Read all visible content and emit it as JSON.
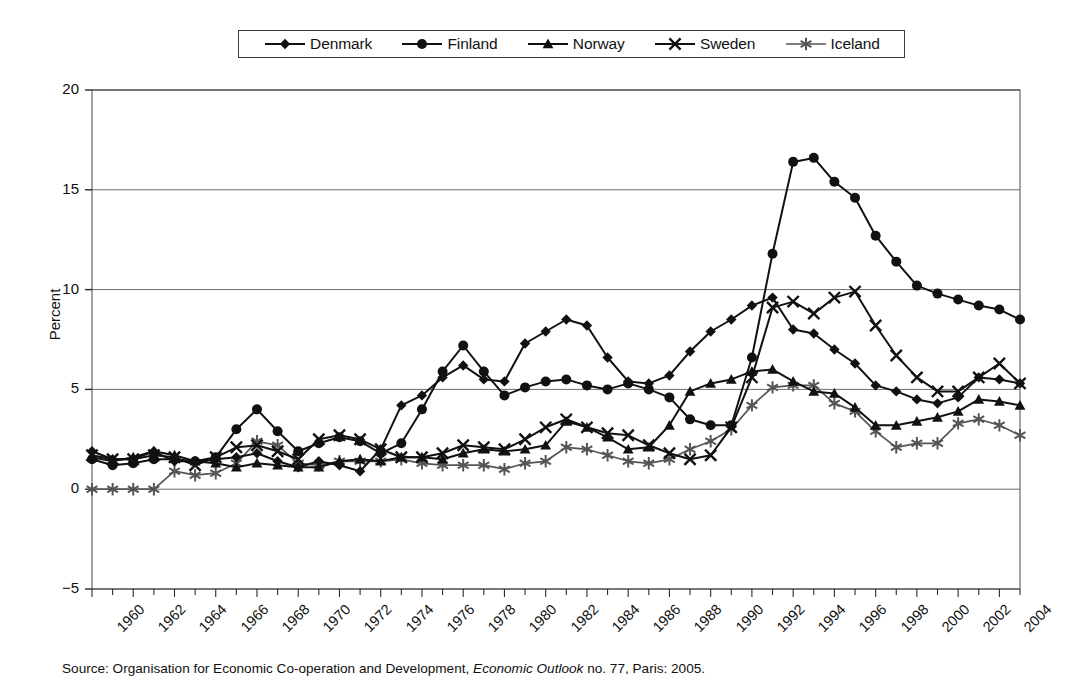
{
  "figure": {
    "ylabel": "Percent",
    "source_prefix": "Source: Organisation for Economic Co-operation and Development, ",
    "source_italic": "Economic Outlook",
    "source_suffix": " no. 77, Paris: 2005."
  },
  "legend": {
    "entries": [
      {
        "label": "Denmark",
        "marker": "diamond-marker"
      },
      {
        "label": "Finland",
        "marker": "circle-marker"
      },
      {
        "label": "Norway",
        "marker": "triangle-marker"
      },
      {
        "label": "Sweden",
        "marker": "x-marker"
      },
      {
        "label": "Iceland",
        "marker": "asterisk-marker"
      }
    ]
  },
  "chart_data": {
    "type": "line",
    "title": "",
    "xlabel": "",
    "ylabel": "Percent",
    "xlim": [
      1960,
      2005
    ],
    "ylim": [
      -5,
      20
    ],
    "yticks": [
      -5,
      0,
      5,
      10,
      15,
      20
    ],
    "xticks": [
      1960,
      1962,
      1964,
      1966,
      1968,
      1970,
      1972,
      1974,
      1976,
      1978,
      1980,
      1982,
      1984,
      1986,
      1988,
      1990,
      1992,
      1994,
      1996,
      1998,
      2000,
      2002,
      2004
    ],
    "grid": "horizontal",
    "legend_position": "top",
    "x": [
      1960,
      1961,
      1962,
      1963,
      1964,
      1965,
      1966,
      1967,
      1968,
      1969,
      1970,
      1971,
      1972,
      1973,
      1974,
      1975,
      1976,
      1977,
      1978,
      1979,
      1980,
      1981,
      1982,
      1983,
      1984,
      1985,
      1986,
      1987,
      1988,
      1989,
      1990,
      1991,
      1992,
      1993,
      1994,
      1995,
      1996,
      1997,
      1998,
      1999,
      2000,
      2001,
      2002,
      2003,
      2004,
      2005
    ],
    "series": [
      {
        "name": "Denmark",
        "marker": "diamond",
        "color": "#111111",
        "values": [
          1.9,
          1.5,
          1.5,
          1.9,
          1.4,
          1.4,
          1.5,
          1.6,
          1.8,
          1.4,
          1.1,
          1.4,
          1.2,
          0.9,
          2.0,
          4.2,
          4.7,
          5.6,
          6.2,
          5.5,
          5.4,
          7.3,
          7.9,
          8.5,
          8.2,
          6.6,
          5.4,
          5.3,
          5.7,
          6.9,
          7.9,
          8.5,
          9.2,
          9.6,
          8.0,
          7.8,
          7.0,
          6.3,
          5.2,
          4.9,
          4.5,
          4.3,
          4.6,
          5.6,
          5.5,
          5.3
        ]
      },
      {
        "name": "Finland",
        "marker": "circle",
        "color": "#111111",
        "values": [
          1.5,
          1.2,
          1.3,
          1.5,
          1.5,
          1.4,
          1.6,
          3.0,
          4.0,
          2.9,
          1.9,
          2.3,
          2.6,
          2.4,
          1.8,
          2.3,
          4.0,
          5.9,
          7.2,
          5.9,
          4.7,
          5.1,
          5.4,
          5.5,
          5.2,
          5.0,
          5.3,
          5.0,
          4.6,
          3.5,
          3.2,
          3.2,
          6.6,
          11.8,
          16.4,
          16.6,
          15.4,
          14.6,
          12.7,
          11.4,
          10.2,
          9.8,
          9.5,
          9.2,
          9.0,
          8.5
        ]
      },
      {
        "name": "Norway",
        "marker": "triangle",
        "color": "#111111",
        "values": [
          1.6,
          1.4,
          1.6,
          1.9,
          1.7,
          1.4,
          1.3,
          1.1,
          1.3,
          1.2,
          1.1,
          1.1,
          1.4,
          1.5,
          1.4,
          1.6,
          1.6,
          1.5,
          1.8,
          2.0,
          1.9,
          2.0,
          2.2,
          3.4,
          3.1,
          2.6,
          2.0,
          2.1,
          3.2,
          4.9,
          5.3,
          5.5,
          5.9,
          6.0,
          5.4,
          4.9,
          4.8,
          4.1,
          3.2,
          3.2,
          3.4,
          3.6,
          3.9,
          4.5,
          4.4,
          4.2
        ]
      },
      {
        "name": "Sweden",
        "marker": "x",
        "color": "#111111",
        "values": [
          1.7,
          1.5,
          1.5,
          1.7,
          1.6,
          1.2,
          1.6,
          2.1,
          2.2,
          1.9,
          1.5,
          2.5,
          2.7,
          2.5,
          2.0,
          1.6,
          1.6,
          1.8,
          2.2,
          2.1,
          2.0,
          2.5,
          3.1,
          3.5,
          3.1,
          2.8,
          2.7,
          2.2,
          1.8,
          1.5,
          1.7,
          3.1,
          5.6,
          9.1,
          9.4,
          8.8,
          9.6,
          9.9,
          8.2,
          6.7,
          5.6,
          4.9,
          4.9,
          5.6,
          6.3,
          5.3
        ]
      },
      {
        "name": "Iceland",
        "marker": "asterisk",
        "color": "#555555",
        "values": [
          0.0,
          0.0,
          0.0,
          0.0,
          0.9,
          0.7,
          0.8,
          1.3,
          2.4,
          2.2,
          1.3,
          1.2,
          1.4,
          1.4,
          1.4,
          1.5,
          1.3,
          1.2,
          1.2,
          1.2,
          1.0,
          1.3,
          1.4,
          2.1,
          2.0,
          1.7,
          1.4,
          1.3,
          1.5,
          2.0,
          2.4,
          3.0,
          4.2,
          5.1,
          5.2,
          5.2,
          4.3,
          3.9,
          2.9,
          2.1,
          2.3,
          2.3,
          3.3,
          3.5,
          3.2,
          2.7
        ]
      }
    ]
  }
}
